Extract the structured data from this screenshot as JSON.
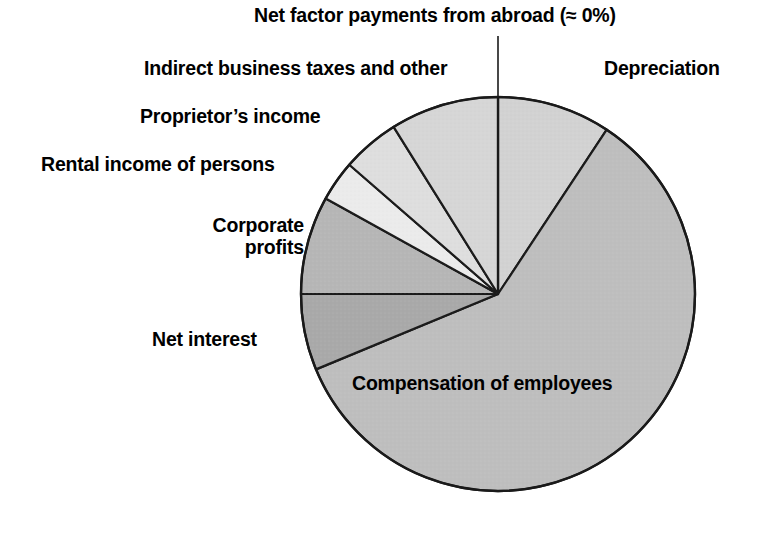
{
  "chart_data": {
    "type": "pie",
    "title": "",
    "legend_position": "outside-callouts",
    "center": {
      "x": 498,
      "y": 294
    },
    "radius": 197,
    "start_angle_deg": 0,
    "direction": "mixed",
    "categories": [
      "Compensation of employees",
      "Depreciation",
      "Indirect business taxes and other",
      "Proprietor's income",
      "Rental income of persons",
      "Corporate profits",
      "Net interest",
      "Net factor payments from abroad (≈ 0%)"
    ],
    "values": [
      59.4,
      9.3,
      8.9,
      4.7,
      3.3,
      8.1,
      6.3,
      0
    ],
    "slices": [
      {
        "label": "Depreciation",
        "start_deg": 0,
        "end_deg": 33.5,
        "value": 9.3,
        "color": "#d2d2d2"
      },
      {
        "label": "Compensation of employees",
        "start_deg": 33.5,
        "end_deg": 247.5,
        "value": 59.4,
        "color": "#bebebe"
      },
      {
        "label": "Net interest",
        "start_deg": 247.5,
        "end_deg": 270,
        "value": 6.3,
        "color": "#a9a9a9"
      },
      {
        "label": "Corporate profits",
        "start_deg": 270,
        "end_deg": 299,
        "value": 8.1,
        "color": "#b6b6b6"
      },
      {
        "label": "Rental income of persons",
        "start_deg": 299,
        "end_deg": 311,
        "value": 3.3,
        "color": "#ebebeb"
      },
      {
        "label": "Proprietor's income",
        "start_deg": 311,
        "end_deg": 328,
        "value": 4.7,
        "color": "#dedede"
      },
      {
        "label": "Indirect business taxes and other",
        "start_deg": 328,
        "end_deg": 360,
        "value": 8.9,
        "color": "#d6d6d6"
      }
    ],
    "zero_marker": {
      "label": "Net factor payments from abroad (≈ 0%)",
      "angle_deg": 0,
      "value": 0
    }
  },
  "labels": {
    "net_factor": "Net factor payments from abroad (≈ 0%)",
    "indirect": "Indirect business taxes and other",
    "depreciation": "Depreciation",
    "proprietor": "Proprietor’s income",
    "rental": "Rental income of persons",
    "corporate": "Corporate\nprofits",
    "net_interest": "Net interest",
    "compensation": "Compensation of employees"
  },
  "colors": {
    "background": "#ffffff",
    "outline": "#1a1a1a",
    "text": "#000000",
    "leader_line": "#1a1a1a"
  }
}
